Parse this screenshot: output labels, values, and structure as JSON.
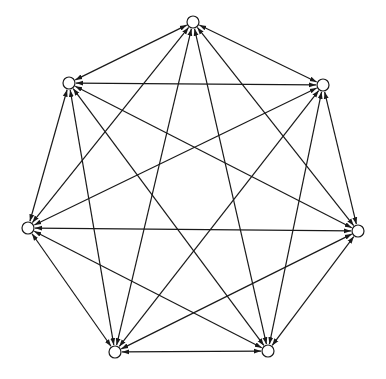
{
  "diagram": {
    "type": "directed-graph",
    "nodes": [
      {
        "id": "n0",
        "label": ""
      },
      {
        "id": "n1",
        "label": ""
      },
      {
        "id": "n2",
        "label": ""
      },
      {
        "id": "n3",
        "label": ""
      },
      {
        "id": "n4",
        "label": ""
      },
      {
        "id": "n5",
        "label": ""
      },
      {
        "id": "n6",
        "label": ""
      }
    ],
    "edges_bidirectional": true,
    "edges": [
      [
        "n0",
        "n1"
      ],
      [
        "n0",
        "n2"
      ],
      [
        "n0",
        "n3"
      ],
      [
        "n0",
        "n4"
      ],
      [
        "n0",
        "n5"
      ],
      [
        "n0",
        "n6"
      ],
      [
        "n1",
        "n2"
      ],
      [
        "n1",
        "n3"
      ],
      [
        "n1",
        "n4"
      ],
      [
        "n1",
        "n5"
      ],
      [
        "n1",
        "n6"
      ],
      [
        "n2",
        "n3"
      ],
      [
        "n2",
        "n4"
      ],
      [
        "n2",
        "n5"
      ],
      [
        "n2",
        "n6"
      ],
      [
        "n3",
        "n4"
      ],
      [
        "n3",
        "n5"
      ],
      [
        "n3",
        "n6"
      ],
      [
        "n4",
        "n5"
      ],
      [
        "n4",
        "n6"
      ],
      [
        "n5",
        "n6"
      ]
    ],
    "colors": {
      "stroke": "#1a1a1a",
      "node_fill": "#ffffff"
    }
  }
}
